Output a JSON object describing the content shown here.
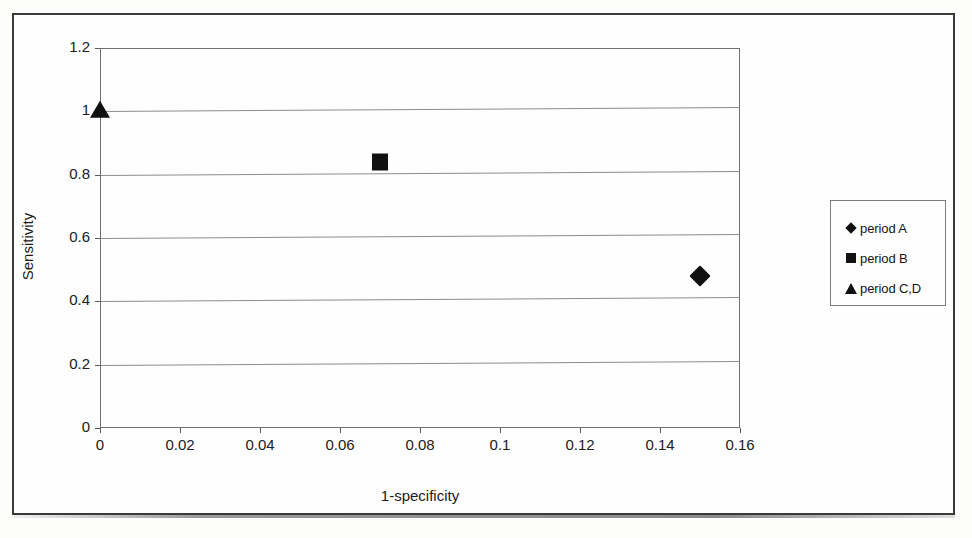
{
  "figure": {
    "background_color": "#fdfdfc",
    "frame_color": "#3a3a3a",
    "plot_line_color": "#6f6f6f",
    "marker_color": "#111111"
  },
  "chart_data": {
    "type": "scatter",
    "title": "",
    "xlabel": "1-specificity",
    "ylabel": "Sensitivity",
    "xlim": [
      0,
      0.16
    ],
    "ylim": [
      0,
      1.2
    ],
    "xticks": [
      "0",
      "0.02",
      "0.04",
      "0.06",
      "0.08",
      "0.1",
      "0.12",
      "0.14",
      "0.16"
    ],
    "xtick_values": [
      0,
      0.02,
      0.04,
      0.06,
      0.08,
      0.1,
      0.12,
      0.14,
      0.16
    ],
    "yticks": [
      "0",
      "0.2",
      "0.4",
      "0.6",
      "0.8",
      "1",
      "1.2"
    ],
    "ytick_values": [
      0,
      0.2,
      0.4,
      0.6,
      0.8,
      1,
      1.2
    ],
    "grid": "horizontal",
    "legend_position": "right-outside",
    "series": [
      {
        "name": "period A",
        "marker": "diamond",
        "points": [
          {
            "x": 0.15,
            "y": 0.48
          }
        ]
      },
      {
        "name": "period B",
        "marker": "square",
        "points": [
          {
            "x": 0.07,
            "y": 0.84
          }
        ]
      },
      {
        "name": "period C,D",
        "marker": "triangle",
        "points": [
          {
            "x": 0.0,
            "y": 1.0
          }
        ]
      }
    ]
  },
  "legend": {
    "items": [
      {
        "label": "period A",
        "marker": "diamond"
      },
      {
        "label": "period B",
        "marker": "square"
      },
      {
        "label": "period C,D",
        "marker": "triangle"
      }
    ]
  }
}
